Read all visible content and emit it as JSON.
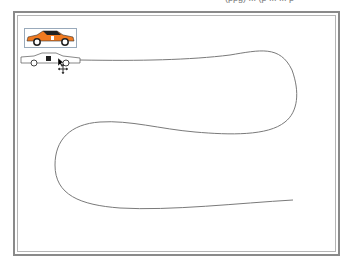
{
  "header": {
    "clipped_text": "(ppg) ... (p  ...  ... p"
  },
  "canvas": {
    "frame_color": "#8a8a8a",
    "path_color": "#7a7a7a",
    "path": {
      "start": [
        80,
        60
      ],
      "end": [
        293,
        200
      ]
    }
  },
  "objects": [
    {
      "name": "orange-car",
      "color": "#f07a20",
      "selected": true
    },
    {
      "name": "outline-car",
      "color": "#666666",
      "selected": false
    }
  ],
  "cursor": {
    "type": "move"
  }
}
